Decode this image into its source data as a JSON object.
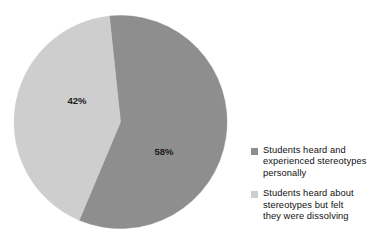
{
  "chart_data": {
    "type": "pie",
    "title": "",
    "xlabel": "",
    "ylabel": "",
    "categories": [
      "Students heard and experienced stereotypes personally",
      "Students heard about stereotypes but felt they were dissolving"
    ],
    "values": [
      58,
      42
    ],
    "value_labels": [
      "58%",
      "42%"
    ],
    "colors": [
      "#8e8e8e",
      "#cecece"
    ],
    "legend_position": "right",
    "grid": false,
    "start_angle_deg": -6,
    "direction": "clockwise"
  },
  "slices": [
    {
      "name": "heard-and-experienced",
      "label": "58%",
      "value": 58,
      "color": "#8e8e8e",
      "label_x": 164,
      "label_y": 155
    },
    {
      "name": "heard-about-dissolving",
      "label": "42%",
      "value": 42,
      "color": "#cecece",
      "label_x": 77,
      "label_y": 104
    }
  ],
  "legend": {
    "entries": [
      {
        "color": "#8e8e8e",
        "lines": [
          "Students heard and",
          "experienced stereotypes",
          "personally"
        ]
      },
      {
        "color": "#cecece",
        "lines": [
          "Students heard about",
          "stereotypes but felt",
          "they were dissolving"
        ]
      }
    ]
  }
}
